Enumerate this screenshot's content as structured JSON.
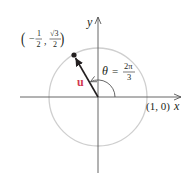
{
  "diagram": {
    "type": "unit-circle-vector",
    "axes": {
      "x_label": "x",
      "y_label": "y"
    },
    "circle": {
      "description": "unit circle",
      "stroke_color": "#c8c8c8"
    },
    "vector": {
      "name": "u",
      "color": "#d2374f",
      "endpoint_label": {
        "x_num": "1",
        "x_den": "2",
        "x_sign": "−",
        "y_num": "√3",
        "y_den": "2"
      }
    },
    "angle": {
      "symbol": "θ",
      "equals": "=",
      "num": "2π",
      "den": "3"
    },
    "point_on_x_axis": {
      "label": "(1, 0)"
    }
  }
}
